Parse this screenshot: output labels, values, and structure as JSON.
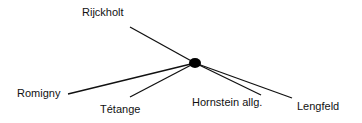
{
  "diagram": {
    "type": "star-network",
    "hub": {
      "x": 195,
      "y": 63,
      "r": 5
    },
    "line_color": "#111111",
    "nodes": [
      {
        "label": "Rijckholt",
        "x": 130,
        "y": 27,
        "lx": 82,
        "ly": 6
      },
      {
        "label": "Romigny",
        "x": 68,
        "y": 94,
        "lx": 17,
        "ly": 87
      },
      {
        "label": "Tétange",
        "x": 130,
        "y": 97,
        "lx": 100,
        "ly": 103
      },
      {
        "label": "Hornstein allg.",
        "x": 261,
        "y": 95,
        "lx": 192,
        "ly": 96
      },
      {
        "label": "Lengfeld",
        "x": 292,
        "y": 98,
        "lx": 297,
        "ly": 100
      }
    ]
  }
}
